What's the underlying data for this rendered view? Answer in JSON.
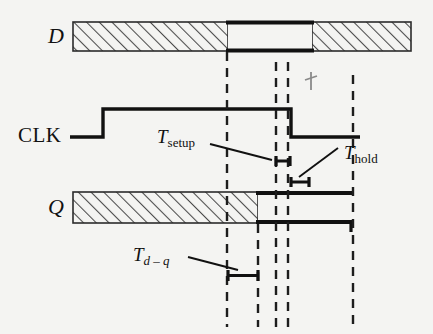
{
  "figure": {
    "kind": "flip-flop-timing-diagram",
    "background_color": "#f4f4f2",
    "ink_color": "#111111",
    "hatch_color": "#555555",
    "width": 433,
    "height": 334
  },
  "signals": {
    "d": {
      "name": "D",
      "label": "D",
      "style": "italic",
      "bar": {
        "x1": 73,
        "x2": 411,
        "y1": 22,
        "y2": 51
      },
      "valid_window": {
        "x1": 228,
        "x2": 312
      },
      "label_pos": {
        "x": 48,
        "y": 25
      }
    },
    "clk": {
      "name": "CLK",
      "label": "CLK",
      "style": "upright",
      "low_y": 137,
      "high_y": 109,
      "x_start": 70,
      "rise_x": 103,
      "fall_x": 291,
      "x_end": 360,
      "label_pos": {
        "x": 18,
        "y": 125
      }
    },
    "q": {
      "name": "Q",
      "label": "Q",
      "style": "italic",
      "bar": {
        "x1": 73,
        "x2": 352,
        "y1": 192,
        "y2": 223
      },
      "valid_from_x": 258,
      "label_pos": {
        "x": 48,
        "y": 196
      }
    }
  },
  "timing_markers": [
    {
      "id": "t-setup",
      "label_base": "T",
      "label_sub": "setup",
      "sub_italic": false,
      "label_pos": {
        "x": 157,
        "y": 127
      },
      "leader": {
        "x1": 210,
        "y1": 144,
        "x2": 272,
        "y2": 160
      },
      "bracket": {
        "x1": 276,
        "x2": 290,
        "y": 161,
        "tick": 7
      }
    },
    {
      "id": "t-hold",
      "label_base": "T",
      "label_sub": "hold",
      "sub_italic": false,
      "label_pos": {
        "x": 344,
        "y": 143
      },
      "leader": {
        "x1": 338,
        "y1": 148,
        "x2": 299,
        "y2": 177
      },
      "bracket": {
        "x1": 291,
        "x2": 309,
        "y": 182,
        "tick": 7
      }
    },
    {
      "id": "t-d-q",
      "label_base": "T",
      "label_sub": "d – q",
      "sub_italic": true,
      "label_pos": {
        "x": 133,
        "y": 245
      },
      "leader": {
        "x1": 188,
        "y1": 257,
        "x2": 238,
        "y2": 270
      },
      "bracket": {
        "x1": 228,
        "x2": 258,
        "y": 275,
        "tick": 7
      }
    }
  ],
  "guide_lines": [
    {
      "id": "guide-d-change",
      "x": 227,
      "y1": 52,
      "y2": 327
    },
    {
      "id": "guide-q-change",
      "x": 258,
      "y1": 224,
      "y2": 327
    },
    {
      "id": "guide-setup-start",
      "x": 276,
      "y1": 62,
      "y2": 327
    },
    {
      "id": "guide-clk-edge",
      "x": 288,
      "y1": 62,
      "y2": 327
    },
    {
      "id": "guide-hold-end",
      "x": 353,
      "y1": 75,
      "y2": 327
    }
  ],
  "arrow_tick": {
    "x": 311,
    "y1": 72,
    "y2": 90
  }
}
